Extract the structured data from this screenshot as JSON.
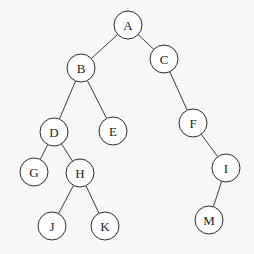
{
  "diagram": {
    "type": "binary-tree",
    "nodes": [
      {
        "id": "A",
        "label": "A",
        "x": 128,
        "y": 25
      },
      {
        "id": "B",
        "label": "B",
        "x": 81,
        "y": 68
      },
      {
        "id": "C",
        "label": "C",
        "x": 164,
        "y": 59
      },
      {
        "id": "D",
        "label": "D",
        "x": 54,
        "y": 132
      },
      {
        "id": "E",
        "label": "E",
        "x": 113,
        "y": 131
      },
      {
        "id": "F",
        "label": "F",
        "x": 193,
        "y": 123
      },
      {
        "id": "G",
        "label": "G",
        "x": 34,
        "y": 172
      },
      {
        "id": "H",
        "label": "H",
        "x": 80,
        "y": 173
      },
      {
        "id": "I",
        "label": "I",
        "x": 226,
        "y": 168
      },
      {
        "id": "J",
        "label": "J",
        "x": 52,
        "y": 226
      },
      {
        "id": "K",
        "label": "K",
        "x": 105,
        "y": 226
      },
      {
        "id": "M",
        "label": "M",
        "x": 209,
        "y": 220
      }
    ],
    "edges": [
      [
        "A",
        "B"
      ],
      [
        "A",
        "C"
      ],
      [
        "B",
        "D"
      ],
      [
        "B",
        "E"
      ],
      [
        "C",
        "F"
      ],
      [
        "D",
        "G"
      ],
      [
        "D",
        "H"
      ],
      [
        "F",
        "I"
      ],
      [
        "H",
        "J"
      ],
      [
        "H",
        "K"
      ],
      [
        "I",
        "M"
      ]
    ],
    "node_radius": 14
  }
}
